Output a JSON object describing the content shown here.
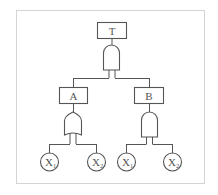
{
  "diagram": {
    "type": "fault-tree",
    "top_event": {
      "label": "T",
      "gate": "AND"
    },
    "intermediate_events": [
      {
        "label": "A",
        "gate": "OR",
        "children": [
          "X1",
          "X2"
        ]
      },
      {
        "label": "B",
        "gate": "AND",
        "children": [
          "X1",
          "X2"
        ]
      }
    ],
    "basic_events": [
      {
        "base": "X",
        "sub": "1"
      },
      {
        "base": "X",
        "sub": "2"
      },
      {
        "base": "X",
        "sub": "1"
      },
      {
        "base": "X",
        "sub": "2"
      }
    ]
  },
  "colors": {
    "stroke": "#555555",
    "frame": "#d4d4d4",
    "background": "#ffffff"
  }
}
